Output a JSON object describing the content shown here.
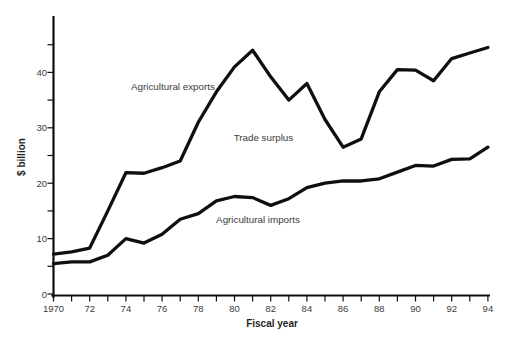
{
  "figure": {
    "width": 514,
    "height": 345,
    "background": "#ffffff",
    "line_color": "#0f0f0f",
    "text_color": "#3b3b3b",
    "title_color": "#1f1f1f"
  },
  "chart_data": {
    "type": "line",
    "title": "",
    "xlabel": "Fiscal year",
    "ylabel": "$ billion",
    "xlim": [
      1970,
      1994
    ],
    "ylim": [
      0,
      49.5
    ],
    "grid": false,
    "legend": "inline-labels",
    "x": [
      1970,
      1971,
      1972,
      1973,
      1974,
      1975,
      1976,
      1977,
      1978,
      1979,
      1980,
      1981,
      1982,
      1983,
      1984,
      1985,
      1986,
      1987,
      1988,
      1989,
      1990,
      1991,
      1992,
      1993,
      1994
    ],
    "series": [
      {
        "id": "agricultural-exports",
        "name": "Agricultural exports",
        "values": [
          7.2,
          7.6,
          8.3,
          15.0,
          21.9,
          21.8,
          22.8,
          24.0,
          31.0,
          36.5,
          41.0,
          44.0,
          39.2,
          35.0,
          38.0,
          31.5,
          26.5,
          28.0,
          36.5,
          40.5,
          40.4,
          38.5,
          42.5,
          43.5,
          44.5
        ]
      },
      {
        "id": "agricultural-imports",
        "name": "Agricultural imports",
        "values": [
          5.5,
          5.8,
          5.8,
          7.0,
          10.0,
          9.2,
          10.8,
          13.5,
          14.5,
          16.8,
          17.6,
          17.4,
          16.0,
          17.2,
          19.2,
          20.0,
          20.4,
          20.4,
          20.8,
          22.0,
          23.2,
          23.1,
          24.3,
          24.4,
          26.5
        ]
      }
    ],
    "x_tick_years": [
      1970,
      1972,
      1974,
      1976,
      1978,
      1980,
      1982,
      1984,
      1986,
      1988,
      1990,
      1992,
      1994
    ],
    "x_tick_labels": [
      "1970",
      "72",
      "74",
      "76",
      "78",
      "80",
      "82",
      "84",
      "86",
      "88",
      "90",
      "92",
      "94"
    ],
    "y_tick_values": [
      0,
      10,
      20,
      30,
      40
    ],
    "y_tick_labels": [
      "0",
      "10",
      "20",
      "30",
      "40"
    ],
    "y_minor_ticks": [
      5,
      15,
      25,
      35,
      45
    ],
    "annotations": [
      {
        "id": "agricultural-exports-label",
        "text": "Agricultural exports",
        "x": 1976.6,
        "y": 37.4
      },
      {
        "id": "trade-surplus-label",
        "text": "Trade surplus",
        "x": 1981.6,
        "y": 28.2
      },
      {
        "id": "agricultural-imports-label",
        "text": "Agricultural imports",
        "x": 1981.3,
        "y": 13.5
      }
    ]
  }
}
